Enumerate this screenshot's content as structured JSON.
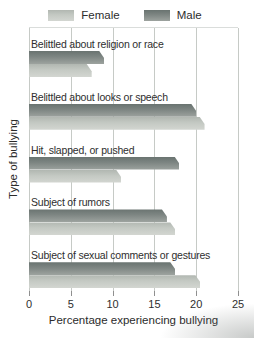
{
  "figure": {
    "legend": [
      {
        "label": "Female"
      },
      {
        "label": "Male"
      }
    ]
  },
  "chart_data": {
    "type": "bar",
    "orientation": "horizontal",
    "title": "",
    "xlabel": "Percentage experiencing bullying",
    "ylabel": "Type of bullying",
    "xlim": [
      0,
      25
    ],
    "xticks": [
      0,
      5,
      10,
      15,
      20,
      25
    ],
    "grid": true,
    "legend_position": "top",
    "categories": [
      "Belittled about religion or race",
      "Belittled about looks or speech",
      "Hit, slapped, or pushed",
      "Subject of rumors",
      "Subject of sexual comments or gestures"
    ],
    "series": [
      {
        "name": "Male",
        "values": [
          9,
          20,
          18,
          16.5,
          17.5
        ]
      },
      {
        "name": "Female",
        "values": [
          7.5,
          21,
          11,
          17.5,
          20.5
        ]
      }
    ],
    "series_draw_order": [
      "Male",
      "Female"
    ]
  },
  "colors": {
    "male_top": "#66706c",
    "male_gradient_top": "#697370",
    "male_gradient_bottom": "#9da39f",
    "female_gradient_top": "#b1b7b1",
    "female_gradient_bottom": "#d3d6d1",
    "gridline": "#c6cac6",
    "tick": "#8f8f8f",
    "text": "#2e2e2e"
  }
}
